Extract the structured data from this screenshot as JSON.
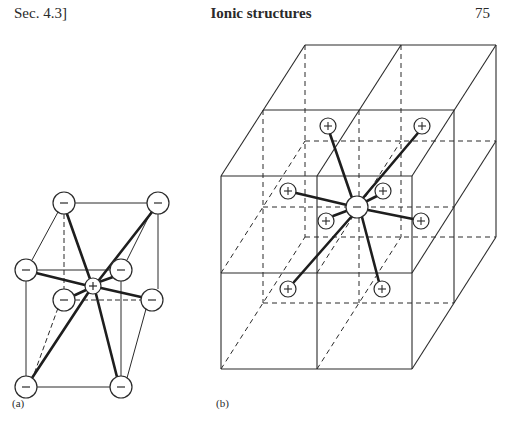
{
  "header": {
    "section": "Sec. 4.3]",
    "title": "Ionic structures",
    "page_number": "75"
  },
  "figures": [
    {
      "label": "(a)",
      "description": "Cation (+) at the centre of a cube of eight anions (−), eightfold cubic coordination",
      "central_ion": "+",
      "surrounding_ions": [
        "−",
        "−",
        "−",
        "−",
        "−",
        "−",
        "−",
        "−"
      ],
      "coordination_number": 8
    },
    {
      "label": "(b)",
      "description": "Anion (−) at the common corner of eight cubes, surrounded by eight cations (+) at the cube centres",
      "central_ion": "−",
      "surrounding_ions": [
        "+",
        "+",
        "+",
        "+",
        "+",
        "+",
        "+",
        "+"
      ],
      "coordination_number": 8
    }
  ],
  "symbols": {
    "anion": "−",
    "cation": "+"
  },
  "colors": {
    "ink": "#2a2a2a",
    "paper": "#ffffff"
  }
}
